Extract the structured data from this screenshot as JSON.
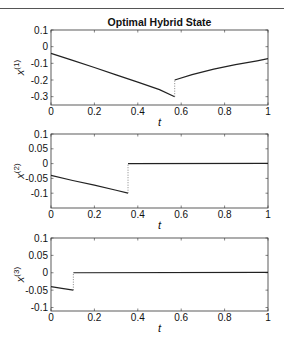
{
  "chart_data": [
    {
      "type": "line",
      "title": "Optimal Hybrid State",
      "xlabel": "t",
      "ylabel": "x^(1)",
      "ylabel_base": "x",
      "ylabel_sup": "(1)",
      "xlim": [
        0,
        1
      ],
      "ylim": [
        -0.35,
        0.1
      ],
      "xticks": [
        0,
        0.2,
        0.4,
        0.6,
        0.8,
        1
      ],
      "xtick_labels": [
        "0",
        "0.2",
        "0.4",
        "0.6",
        "0.8",
        "1"
      ],
      "yticks": [
        0.1,
        0,
        -0.1,
        -0.2,
        -0.3
      ],
      "ytick_labels": [
        "0.1",
        "0",
        "-0.1",
        "-0.2",
        "-0.3"
      ],
      "grid": false,
      "series": [
        {
          "name": "x1 segment 1",
          "style": "solid",
          "x": [
            0,
            0.1,
            0.2,
            0.3,
            0.4,
            0.5,
            0.57
          ],
          "y": [
            -0.04,
            -0.082,
            -0.125,
            -0.169,
            -0.213,
            -0.258,
            -0.3
          ]
        },
        {
          "name": "x1 jump",
          "style": "dotted",
          "x": [
            0.57,
            0.57
          ],
          "y": [
            -0.3,
            -0.2
          ]
        },
        {
          "name": "x1 segment 2",
          "style": "solid",
          "x": [
            0.57,
            0.65,
            0.75,
            0.85,
            0.95,
            1.0
          ],
          "y": [
            -0.2,
            -0.168,
            -0.135,
            -0.108,
            -0.085,
            -0.072
          ]
        }
      ]
    },
    {
      "type": "line",
      "title": "",
      "xlabel": "t",
      "ylabel": "x^(2)",
      "ylabel_base": "x",
      "ylabel_sup": "(2)",
      "xlim": [
        0,
        1
      ],
      "ylim": [
        -0.15,
        0.1
      ],
      "xticks": [
        0,
        0.2,
        0.4,
        0.6,
        0.8,
        1
      ],
      "xtick_labels": [
        "0",
        "0.2",
        "0.4",
        "0.6",
        "0.8",
        "1"
      ],
      "yticks": [
        0.1,
        0.05,
        0,
        -0.05,
        -0.1
      ],
      "ytick_labels": [
        "0.1",
        "0.05",
        "0",
        "-0.05",
        "-0.1"
      ],
      "grid": false,
      "series": [
        {
          "name": "x2 segment 1",
          "style": "solid",
          "x": [
            0,
            0.1,
            0.2,
            0.3,
            0.355
          ],
          "y": [
            -0.04,
            -0.057,
            -0.073,
            -0.09,
            -0.1
          ]
        },
        {
          "name": "x2 jump",
          "style": "dotted",
          "x": [
            0.355,
            0.355
          ],
          "y": [
            -0.1,
            0.0
          ]
        },
        {
          "name": "x2 segment 2",
          "style": "solid",
          "x": [
            0.355,
            1.0
          ],
          "y": [
            0.0,
            0.001
          ]
        }
      ]
    },
    {
      "type": "line",
      "title": "",
      "xlabel": "t",
      "ylabel": "x^(3)",
      "ylabel_base": "x",
      "ylabel_sup": "(3)",
      "xlim": [
        0,
        1
      ],
      "ylim": [
        -0.11,
        0.1
      ],
      "xticks": [
        0,
        0.2,
        0.4,
        0.6,
        0.8,
        1
      ],
      "xtick_labels": [
        "0",
        "0.2",
        "0.4",
        "0.6",
        "0.8",
        "1"
      ],
      "yticks": [
        0.1,
        0.05,
        0,
        -0.05,
        -0.1
      ],
      "ytick_labels": [
        "0.1",
        "0.05",
        "0",
        "-0.05",
        "-0.1"
      ],
      "grid": false,
      "series": [
        {
          "name": "x3 segment 1",
          "style": "solid",
          "x": [
            0,
            0.05,
            0.103
          ],
          "y": [
            -0.04,
            -0.045,
            -0.05
          ]
        },
        {
          "name": "x3 jump",
          "style": "dotted",
          "x": [
            0.103,
            0.103
          ],
          "y": [
            -0.05,
            0.0
          ]
        },
        {
          "name": "x3 segment 2",
          "style": "solid",
          "x": [
            0.103,
            1.0
          ],
          "y": [
            0.0,
            0.001
          ]
        }
      ]
    }
  ],
  "layout": {
    "plot_left": 51,
    "plot_right": 268,
    "panels": [
      {
        "top": 30,
        "bottom": 105
      },
      {
        "top": 134,
        "bottom": 208
      },
      {
        "top": 238,
        "bottom": 311
      }
    ],
    "line_color": "#222222",
    "axis_color": "#333333"
  }
}
